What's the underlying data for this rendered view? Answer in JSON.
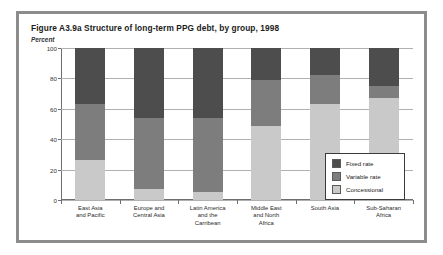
{
  "figure": {
    "title": "Figure A3.9a  Structure of long-term PPG debt, by group, 1998",
    "unit_label": "Percent"
  },
  "chart_data": {
    "type": "bar",
    "stacked": true,
    "title": "Figure A3.9a  Structure of long-term PPG debt, by group, 1998",
    "xlabel": "",
    "ylabel": "Percent",
    "ylim": [
      0,
      100
    ],
    "yticks": [
      0,
      20,
      40,
      60,
      80,
      100
    ],
    "grid": true,
    "legend_position": "inside-right",
    "categories": [
      "East Asia\nand Pacific",
      "Europe and\nCentral Asia",
      "Latin America\nand the\nCarribean",
      "Middle East\nand North\nAfrica",
      "South Asia",
      "Sub-Saharan\nAfrica"
    ],
    "category_lines": [
      [
        "East Asia",
        "and Pacific"
      ],
      [
        "Europe and",
        "Central Asia"
      ],
      [
        "Latin America",
        "and the",
        "Carribean"
      ],
      [
        "Middle East",
        "and North",
        "Africa"
      ],
      [
        "South Asia"
      ],
      [
        "Sub-Saharan",
        "Africa"
      ]
    ],
    "series": [
      {
        "name": "Concessional",
        "color": "#c9c9c9",
        "values": [
          26,
          7,
          5,
          49,
          63,
          67
        ]
      },
      {
        "name": "Variable rate",
        "color": "#7d7d7d",
        "values": [
          37,
          47,
          49,
          30,
          19,
          8
        ]
      },
      {
        "name": "Fixed rate",
        "color": "#4d4d4d",
        "values": [
          37,
          46,
          46,
          21,
          18,
          25
        ]
      }
    ]
  },
  "legend": {
    "items": [
      {
        "label": "Fixed rate",
        "color": "#4d4d4d"
      },
      {
        "label": "Variable rate",
        "color": "#7d7d7d"
      },
      {
        "label": "Concessional",
        "color": "#c9c9c9"
      }
    ]
  }
}
